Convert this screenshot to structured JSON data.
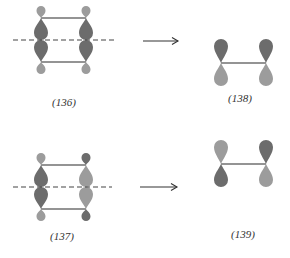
{
  "colors": {
    "dark_lobe": "#6c6c6c",
    "light_lobe": "#9c9c9c",
    "bond": "#2a2a2a",
    "mirror_plane": "#444444",
    "arrow": "#333333"
  },
  "rows": [
    {
      "reactant": {
        "label": "(136)",
        "left_column": {
          "top_small": "light",
          "upper_large": "dark",
          "lower_large": "dark",
          "bottom_small": "light"
        },
        "right_column": {
          "top_small": "light",
          "upper_large": "dark",
          "lower_large": "dark",
          "bottom_small": "light"
        },
        "mirror_plane": "dashed horizontal"
      },
      "arrow": "right",
      "product": {
        "label": "(138)",
        "left_p_orbital": {
          "upper": "dark",
          "lower": "light"
        },
        "right_p_orbital": {
          "upper": "dark",
          "lower": "light"
        }
      }
    },
    {
      "reactant": {
        "label": "(137)",
        "left_column": {
          "top_small": "light",
          "upper_large": "dark",
          "lower_large": "dark",
          "bottom_small": "light"
        },
        "right_column": {
          "top_small": "dark",
          "upper_large": "light",
          "lower_large": "light",
          "bottom_small": "dark"
        },
        "mirror_plane": "dashed horizontal"
      },
      "arrow": "right",
      "product": {
        "label": "(139)",
        "left_p_orbital": {
          "upper": "light",
          "lower": "dark"
        },
        "right_p_orbital": {
          "upper": "dark",
          "lower": "light"
        }
      }
    }
  ]
}
